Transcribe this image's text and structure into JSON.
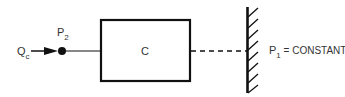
{
  "diagram": {
    "input_flow": {
      "label": "Q",
      "subscript": "c"
    },
    "node": {
      "label": "P",
      "subscript": "2"
    },
    "component": {
      "label": "C"
    },
    "boundary": {
      "label": "P",
      "subscript": "1",
      "suffix": " = CONSTANT"
    },
    "colors": {
      "stroke": "#111111",
      "text": "#333333",
      "background": "#ffffff"
    }
  }
}
